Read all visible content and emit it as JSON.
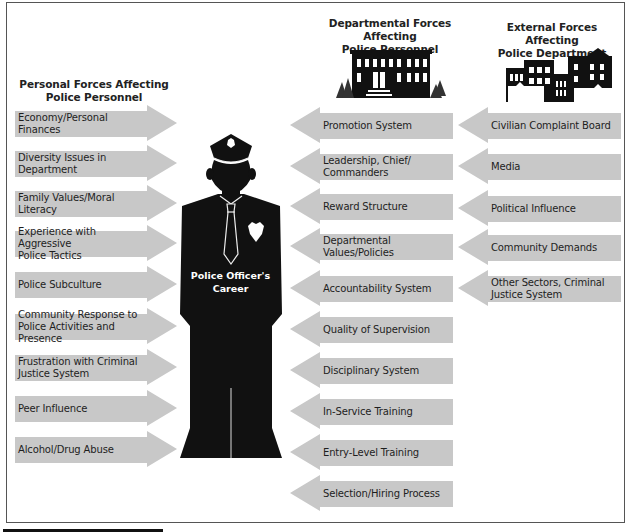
{
  "headings": {
    "personal": "Personal Forces Affecting\nPolice Personnel",
    "personal_line1": "Personal Forces Affecting",
    "personal_line2": "Police Personnel",
    "departmental_line1": "Departmental Forces Affecting",
    "departmental_line2": "Police Personnel",
    "external_line1": "External Forces Affecting",
    "external_line2": "Police Department"
  },
  "center": {
    "label_line1": "Police Officer's",
    "label_line2": "Career"
  },
  "personal_forces": [
    {
      "line1": "Economy/Personal Finances",
      "line2": ""
    },
    {
      "line1": "Diversity Issues in Department",
      "line2": ""
    },
    {
      "line1": "Family Values/Moral Literacy",
      "line2": ""
    },
    {
      "line1": "Experience with Aggressive",
      "line2": "Police Tactics"
    },
    {
      "line1": "Police Subculture",
      "line2": ""
    },
    {
      "line1": "Community Response to",
      "line2": "Police Activities and Presence"
    },
    {
      "line1": "Frustration with Criminal",
      "line2": "Justice System"
    },
    {
      "line1": "Peer Influence",
      "line2": ""
    },
    {
      "line1": "Alcohol/Drug Abuse",
      "line2": ""
    }
  ],
  "departmental_forces": [
    {
      "line1": "Promotion System",
      "line2": ""
    },
    {
      "line1": "Leadership, Chief/",
      "line2": "Commanders"
    },
    {
      "line1": "Reward Structure",
      "line2": ""
    },
    {
      "line1": "Departmental Values/Policies",
      "line2": ""
    },
    {
      "line1": "Accountability System",
      "line2": ""
    },
    {
      "line1": "Quality of Supervision",
      "line2": ""
    },
    {
      "line1": "Disciplinary System",
      "line2": ""
    },
    {
      "line1": "In-Service Training",
      "line2": ""
    },
    {
      "line1": "Entry-Level Training",
      "line2": ""
    },
    {
      "line1": "Selection/Hiring Process",
      "line2": ""
    }
  ],
  "external_forces": [
    {
      "line1": "Civilian Complaint Board",
      "line2": ""
    },
    {
      "line1": "Media",
      "line2": ""
    },
    {
      "line1": "Political Influence",
      "line2": ""
    },
    {
      "line1": "Community Demands",
      "line2": ""
    },
    {
      "line1": "Other Sectors, Criminal",
      "line2": "Justice System"
    }
  ],
  "colors": {
    "arrow_fill": "#c8c8c8",
    "silhouette": "#111111",
    "frame": "#555555"
  },
  "icons": {
    "center_figure": "police-officer-silhouette-icon",
    "departmental": "police-station-building-icon",
    "external": "city-buildings-icon"
  }
}
